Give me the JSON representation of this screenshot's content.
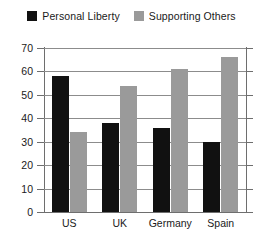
{
  "chart_data": {
    "type": "bar",
    "title": "",
    "subtitle": "",
    "xlabel": "",
    "ylabel": "",
    "categories": [
      "US",
      "UK",
      "Germany",
      "Spain"
    ],
    "series": [
      {
        "name": "Personal Liberty",
        "color": "#111111",
        "values": [
          58,
          38,
          36,
          30
        ]
      },
      {
        "name": "Supporting Others",
        "color": "#9a9a9a",
        "values": [
          34,
          54,
          61,
          66
        ]
      }
    ],
    "ylim": [
      0,
      70
    ],
    "ytick_step": 10,
    "yticks": [
      0,
      10,
      20,
      30,
      40,
      50,
      60,
      70
    ],
    "ytick_labels": [
      "0",
      "10",
      "20",
      "30",
      "40",
      "50",
      "60",
      "70"
    ],
    "grid": true,
    "grid_axis": "y",
    "legend_position": "top-center",
    "annotations": []
  },
  "legend": {
    "entries": [
      {
        "label": "Personal Liberty",
        "swatch_name": "legend-swatch-personal-liberty"
      },
      {
        "label": "Supporting Others",
        "swatch_name": "legend-swatch-supporting-others"
      }
    ]
  },
  "colors": {
    "background": "#ffffff",
    "axis": "#6e6e6e",
    "gridline": "#8c8c8c",
    "text": "#1a1a1a",
    "series_personal_liberty": "#111111",
    "series_supporting_others": "#9a9a9a"
  }
}
